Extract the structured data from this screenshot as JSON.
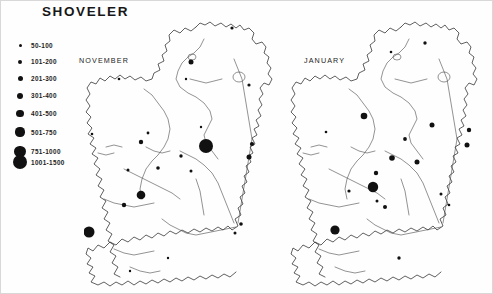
{
  "title": "SHOVELER",
  "legend": {
    "name": "flock-size-legend",
    "classes": [
      {
        "label": "50-100",
        "diameter": 3.0,
        "min": 50,
        "max": 100
      },
      {
        "label": "101-200",
        "diameter": 4.0,
        "min": 101,
        "max": 200
      },
      {
        "label": "201-300",
        "diameter": 5.0,
        "min": 201,
        "max": 300
      },
      {
        "label": "301-400",
        "diameter": 6.4,
        "min": 301,
        "max": 400
      },
      {
        "label": "401-500",
        "diameter": 7.8,
        "min": 401,
        "max": 500
      },
      {
        "label": "501-750",
        "diameter": 9.2,
        "min": 501,
        "max": 750
      },
      {
        "label": "751-1000",
        "diameter": 11.4,
        "min": 751,
        "max": 1000
      },
      {
        "label": "1001-1500",
        "diameter": 14.0,
        "min": 1001,
        "max": 1500
      }
    ]
  },
  "maps": [
    {
      "caption": "NOVEMBER",
      "panel": "november",
      "sites": [
        {
          "x": 107,
          "y": 43,
          "d": 5.0
        },
        {
          "x": 148,
          "y": 9,
          "d": 3.2
        },
        {
          "x": 35,
          "y": 60,
          "d": 2.6
        },
        {
          "x": 102,
          "y": 60,
          "d": 2.4
        },
        {
          "x": 165,
          "y": 66,
          "d": 3.2
        },
        {
          "x": 64,
          "y": 114,
          "d": 2.8
        },
        {
          "x": 57,
          "y": 123,
          "d": 4.4
        },
        {
          "x": 8,
          "y": 115,
          "d": 2.6
        },
        {
          "x": 122,
          "y": 127,
          "d": 14.0
        },
        {
          "x": 117,
          "y": 108,
          "d": 2.4
        },
        {
          "x": 97,
          "y": 137,
          "d": 3.4
        },
        {
          "x": 74,
          "y": 149,
          "d": 3.6
        },
        {
          "x": 44,
          "y": 151,
          "d": 3.0
        },
        {
          "x": 107,
          "y": 152,
          "d": 3.0
        },
        {
          "x": 168,
          "y": 125,
          "d": 4.2
        },
        {
          "x": 165,
          "y": 138,
          "d": 5.0
        },
        {
          "x": 57,
          "y": 176,
          "d": 8.6
        },
        {
          "x": 40,
          "y": 186,
          "d": 4.4
        },
        {
          "x": 5,
          "y": 213,
          "d": 11.0
        },
        {
          "x": 157,
          "y": 205,
          "d": 3.6
        },
        {
          "x": 151,
          "y": 214,
          "d": 3.0
        },
        {
          "x": 84,
          "y": 239,
          "d": 2.4
        },
        {
          "x": 46,
          "y": 252,
          "d": 2.4
        }
      ]
    },
    {
      "caption": "JANUARY",
      "panel": "january",
      "sites": [
        {
          "x": 136,
          "y": 24,
          "d": 3.4
        },
        {
          "x": 102,
          "y": 33,
          "d": 2.6
        },
        {
          "x": 37,
          "y": 113,
          "d": 2.6
        },
        {
          "x": 75,
          "y": 97,
          "d": 6.6
        },
        {
          "x": 143,
          "y": 106,
          "d": 5.0
        },
        {
          "x": 116,
          "y": 120,
          "d": 3.8
        },
        {
          "x": 103,
          "y": 139,
          "d": 5.6
        },
        {
          "x": 128,
          "y": 143,
          "d": 5.0
        },
        {
          "x": 180,
          "y": 111,
          "d": 4.4
        },
        {
          "x": 178,
          "y": 126,
          "d": 5.0
        },
        {
          "x": 87,
          "y": 154,
          "d": 4.4
        },
        {
          "x": 60,
          "y": 172,
          "d": 3.2
        },
        {
          "x": 84,
          "y": 168,
          "d": 10.4
        },
        {
          "x": 96,
          "y": 188,
          "d": 4.0
        },
        {
          "x": 88,
          "y": 182,
          "d": 3.0
        },
        {
          "x": 46,
          "y": 211,
          "d": 9.2
        },
        {
          "x": 152,
          "y": 175,
          "d": 3.0
        },
        {
          "x": 160,
          "y": 186,
          "d": 2.6
        },
        {
          "x": 110,
          "y": 239,
          "d": 3.4
        }
      ]
    }
  ],
  "colors": {
    "ink": "#111111",
    "coastline": "#2b2b2b",
    "river": "#4a4a4a",
    "background": "#ffffff"
  }
}
